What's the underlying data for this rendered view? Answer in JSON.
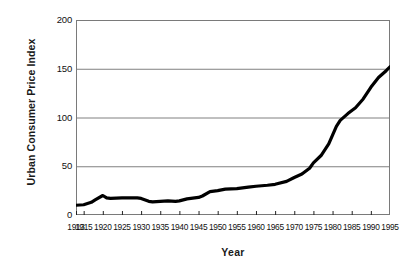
{
  "chart_data": {
    "type": "line",
    "title": "",
    "xlabel": "Year",
    "ylabel": "Urban Consumer Price Index",
    "xlim": [
      1913,
      1995
    ],
    "ylim": [
      0,
      200
    ],
    "grid": true,
    "legend": null,
    "y_ticks": [
      0,
      50,
      100,
      150,
      200
    ],
    "y_tick_labels": [
      "0",
      "50",
      "100",
      "150",
      "200"
    ],
    "x_tick_labels": [
      "1913",
      "1915",
      "1920",
      "1925",
      "1930",
      "1935",
      "1940",
      "1945",
      "1950",
      "1955",
      "1960",
      "1965",
      "1970",
      "1975",
      "1980",
      "1985",
      "1990",
      "1995"
    ],
    "x_tick_values": [
      1913,
      1915,
      1920,
      1925,
      1930,
      1935,
      1940,
      1945,
      1950,
      1955,
      1960,
      1965,
      1970,
      1975,
      1980,
      1985,
      1990,
      1995
    ],
    "line_color": "#000000",
    "line_width": 3.2,
    "grid_color": "#808080",
    "border_color": "#7a7a7a",
    "x": [
      1913,
      1915,
      1917,
      1918,
      1920,
      1921,
      1922,
      1925,
      1927,
      1929,
      1930,
      1932,
      1933,
      1935,
      1937,
      1939,
      1940,
      1942,
      1945,
      1946,
      1948,
      1950,
      1952,
      1955,
      1958,
      1960,
      1963,
      1965,
      1968,
      1970,
      1972,
      1974,
      1975,
      1977,
      1979,
      1980,
      1981,
      1982,
      1984,
      1986,
      1988,
      1990,
      1992,
      1994,
      1995
    ],
    "y": [
      10,
      10.5,
      13,
      15.5,
      20,
      17.5,
      17,
      17.5,
      17.5,
      17.5,
      17,
      14,
      13.5,
      14,
      14.5,
      14,
      14.5,
      16.5,
      18,
      19.5,
      24,
      25,
      26.5,
      27,
      28.5,
      29.5,
      30.5,
      31.5,
      34.5,
      38.5,
      42,
      48,
      53.5,
      61,
      73,
      82,
      91,
      97,
      104,
      110,
      119,
      131,
      141,
      148,
      152
    ],
    "series_name": "Urban Consumer Price Index"
  }
}
